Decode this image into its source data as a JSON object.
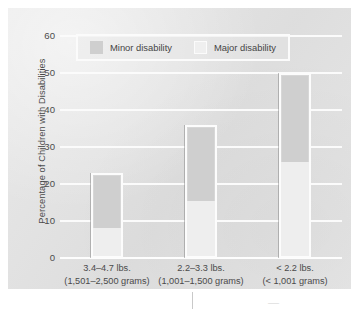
{
  "chart_data": {
    "type": "bar",
    "title": "",
    "subtitle": "",
    "xlabel": "",
    "ylabel": "Percentage of Children with Disabilities",
    "ylim": [
      0,
      60
    ],
    "yticks": [
      0,
      10,
      20,
      30,
      40,
      50,
      60
    ],
    "grid": true,
    "stacked": true,
    "legend_position": "top-inside",
    "categories": [
      "3.4–4.7 lbs. (1,501–2,500 grams)",
      "2.2–3.3 lbs. (1,001–1,500 grams)",
      "< 2.2 lbs. (< 1,001 grams)"
    ],
    "series": [
      {
        "name": "Major disability",
        "values": [
          7.5,
          15,
          25.5
        ]
      },
      {
        "name": "Minor disability",
        "values": [
          15.5,
          21,
          24.5
        ]
      }
    ],
    "totals": [
      23,
      36,
      50
    ]
  },
  "axes": {
    "y_title": "Percentage of Children with Disabilities",
    "y_ticks": [
      "60",
      "50",
      "40",
      "30",
      "20",
      "10",
      "0"
    ]
  },
  "legend": {
    "items": [
      {
        "label": "Minor disability",
        "swatch": "minor-swatch-icon",
        "color": "#cfcfcf"
      },
      {
        "label": "Major disability",
        "swatch": "major-swatch-icon",
        "color": "#efefef"
      }
    ]
  },
  "x_axis": {
    "categories": [
      {
        "line1": "3.4–4.7 lbs.",
        "line2": "(1,501–2,500 grams)"
      },
      {
        "line1": "2.2–3.3 lbs.",
        "line2": "(1,001–1,500 grams)"
      },
      {
        "line1": "< 2.2 lbs.",
        "line2": "(< 1,001 grams)"
      }
    ]
  },
  "colors": {
    "panel_background": "#e2e2e2",
    "gridline": "#fbfbfb",
    "minor_disability": "#cfcfcf",
    "major_disability": "#efefef",
    "bar_outline": "#fcfcfc",
    "text": "#4a4a4a"
  }
}
